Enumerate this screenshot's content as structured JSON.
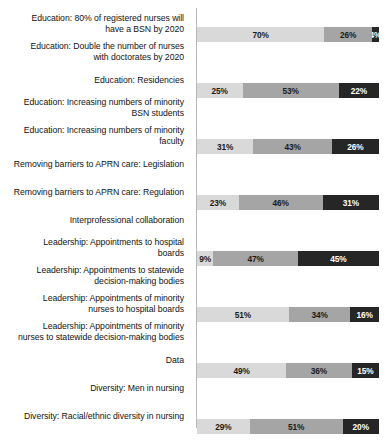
{
  "chart_data": {
    "type": "bar",
    "subtype": "stacked-horizontal-100",
    "title": "",
    "subtitle": "",
    "xlabel": "",
    "ylabel": "",
    "xlim": [
      0,
      100
    ],
    "grid": false,
    "legend_position": "none",
    "unit": "%",
    "series": [
      {
        "name": "segment-1",
        "color": "#d9d9d9"
      },
      {
        "name": "segment-2",
        "color": "#a5a5a5"
      },
      {
        "name": "segment-3",
        "color": "#262626"
      }
    ],
    "categories": [
      "Education: 80% of registered nurses will\nhave a BSN by 2020",
      "Education: Double the number of nurses\nwith doctorates by 2020",
      "Education: Residencies",
      "Education: Increasing numbers of minority\nBSN students",
      "Education: Increasing numbers of minority\nfaculty",
      "Removing barriers to APRN care: Legislation",
      "Removing barriers to APRN care: Regulation",
      "Interprofessional collaboration",
      "Leadership: Appointments to hospital\nboards",
      "Leadership: Appointments to statewide\ndecision-making bodies",
      "Leadership: Appointments of minority\nnurses to hospital boards",
      "Leadership: Appointments of minority\nnurses to statewide decision-making bodies",
      "Data",
      "Diversity: Men in nursing",
      "Diversity: Racial/ethnic diversity in nursing"
    ],
    "rows": [
      {
        "category": "Education: 80% of registered nurses will have a BSN by 2020",
        "values": [
          70,
          26,
          4
        ],
        "labels": [
          "70%",
          "26%",
          "4%"
        ]
      },
      {
        "category": "Education: Double the number of nurses with doctorates by 2020",
        "values": [
          25,
          53,
          22
        ],
        "labels": [
          "25%",
          "53%",
          "22%"
        ]
      },
      {
        "category": "Education: Residencies",
        "values": [
          31,
          43,
          26
        ],
        "labels": [
          "31%",
          "43%",
          "26%"
        ]
      },
      {
        "category": "Education: Increasing numbers of minority BSN students",
        "values": [
          23,
          46,
          31
        ],
        "labels": [
          "23%",
          "46%",
          "31%"
        ]
      },
      {
        "category": "Education: Increasing numbers of minority faculty",
        "values": [
          9,
          47,
          45
        ],
        "labels": [
          "9%",
          "47%",
          "45%"
        ]
      },
      {
        "category": "Removing barriers to APRN care: Legislation",
        "values": [
          51,
          34,
          16
        ],
        "labels": [
          "51%",
          "34%",
          "16%"
        ]
      },
      {
        "category": "Removing barriers to APRN care: Regulation",
        "values": [
          49,
          36,
          15
        ],
        "labels": [
          "49%",
          "36%",
          "15%"
        ]
      },
      {
        "category": "Interprofessional collaboration",
        "values": [
          29,
          51,
          20
        ],
        "labels": [
          "29%",
          "51%",
          "20%"
        ]
      },
      {
        "category": "Leadership: Appointments to hospital boards",
        "values": [
          22,
          43,
          36
        ],
        "labels": [
          "22%",
          "43%",
          "36%"
        ]
      },
      {
        "category": "Leadership: Appointments to statewide decision-making bodies",
        "values": [
          21,
          43,
          35
        ],
        "labels": [
          "21%",
          "43%",
          "35%"
        ]
      },
      {
        "category": "Leadership: Appointments of minority nurses to hospital boards",
        "values": [
          9,
          32,
          59
        ],
        "labels": [
          "9%",
          "32%",
          "59%"
        ]
      },
      {
        "category": "Leadership: Appointments of minority nurses to statewide decision-making bodies",
        "values": [
          10,
          34,
          56
        ],
        "labels": [
          "10%",
          "34%",
          "56%"
        ]
      },
      {
        "category": "Data",
        "values": [
          46,
          44,
          10
        ],
        "labels": [
          "46%",
          "44%",
          "10%"
        ]
      },
      {
        "category": "Diversity: Men in nursing",
        "values": [
          10,
          42,
          48
        ],
        "labels": [
          "10%",
          "42%",
          "48%"
        ]
      },
      {
        "category": "Diversity: Racial/ethnic diversity in nursing",
        "values": [
          18,
          49,
          34
        ],
        "labels": [
          "18%",
          "49%",
          "34%"
        ]
      }
    ]
  }
}
